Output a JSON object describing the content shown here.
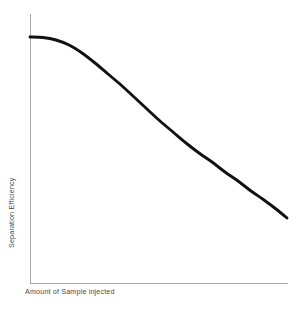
{
  "chart_data": {
    "type": "line",
    "title": "",
    "subtitle": "",
    "xlabel": "Amount of Sample injected",
    "ylabel": "Separation Efficiency",
    "xlim": [
      0,
      100
    ],
    "ylim": [
      0,
      100
    ],
    "grid": false,
    "legend": false,
    "legend_position": "none",
    "x_tick_labels": [],
    "y_tick_labels": [],
    "annotations": [],
    "axis_color": "#a8a8a8",
    "curve_color": "#111111",
    "background_color": "#ffffff",
    "series": [
      {
        "name": "Separation Efficiency vs Sample Load",
        "color": "#111111",
        "line_width": 2.9,
        "description": "Monotonically decreasing sigmoid: high plateau at low sample load, steep decline through mid-range, flattening at high load",
        "x": [
          0,
          5,
          10,
          15,
          20,
          25,
          30,
          35,
          40,
          45,
          50,
          55,
          60,
          65,
          70,
          75,
          80,
          85,
          90,
          95,
          100
        ],
        "y": [
          100,
          99,
          97,
          94,
          89,
          83,
          75,
          67,
          59,
          52,
          45,
          39,
          34,
          30,
          26,
          23,
          20,
          18,
          16,
          14,
          13
        ],
        "pixel_points": [
          [
            30,
            37
          ],
          [
            43,
            37.5
          ],
          [
            56,
            40
          ],
          [
            69,
            45
          ],
          [
            82,
            53
          ],
          [
            95,
            63
          ],
          [
            108,
            74
          ],
          [
            121,
            85
          ],
          [
            134,
            97
          ],
          [
            147,
            109
          ],
          [
            160,
            121
          ],
          [
            173,
            132
          ],
          [
            186,
            143
          ],
          [
            199,
            153
          ],
          [
            212,
            162
          ],
          [
            225,
            172
          ],
          [
            238,
            181
          ],
          [
            251,
            191
          ],
          [
            264,
            200
          ],
          [
            276,
            209
          ],
          [
            287,
            218
          ]
        ]
      }
    ]
  },
  "axes": {
    "y_axis": {
      "name": "y-axis-line",
      "x": 30,
      "y_top": 14,
      "y_bottom": 283
    },
    "x_axis": {
      "name": "x-axis-line",
      "y": 283,
      "x_left": 30,
      "x_right": 288
    }
  },
  "labels": {
    "x_label": "Amount of Sample injected",
    "y_label": "Separation Efficiency"
  }
}
